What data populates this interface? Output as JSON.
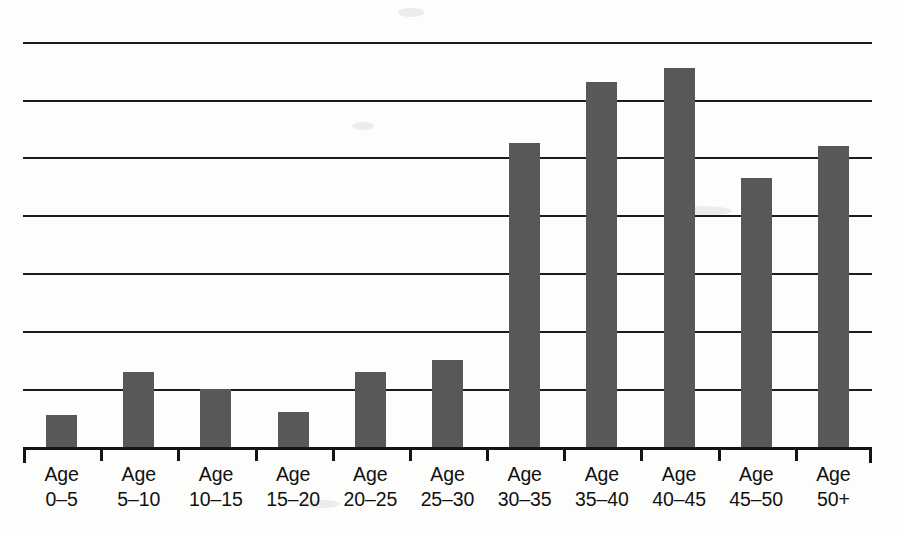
{
  "chart_data": {
    "type": "bar",
    "title": "",
    "subtitle": "",
    "xlabel": "",
    "ylabel": "",
    "categories": [
      "Age 0–5",
      "Age 5–10",
      "Age 10–15",
      "Age 15–20",
      "Age 20–25",
      "Age 25–30",
      "Age 30–35",
      "Age 35–40",
      "Age 40–45",
      "Age 45–50",
      "Age 50+"
    ],
    "category_lines": [
      [
        "Age",
        "0–5"
      ],
      [
        "Age",
        "5–10"
      ],
      [
        "Age",
        "10–15"
      ],
      [
        "Age",
        "15–20"
      ],
      [
        "Age",
        "20–25"
      ],
      [
        "Age",
        "25–30"
      ],
      [
        "Age",
        "30–35"
      ],
      [
        "Age",
        "35–40"
      ],
      [
        "Age",
        "40–45"
      ],
      [
        "Age",
        "45–50"
      ],
      [
        "Age",
        "50+"
      ]
    ],
    "values": [
      0.55,
      1.3,
      1.0,
      0.6,
      1.3,
      1.5,
      5.25,
      6.3,
      6.55,
      4.65,
      5.2
    ],
    "ylim": [
      0,
      7.2
    ],
    "y_gridline_values": [
      1,
      2,
      3,
      4,
      5,
      6,
      7
    ],
    "grid": true,
    "legend": false,
    "legend_position": "none",
    "axis_tick_labels": [],
    "colors": {
      "bar_fill": "#585858",
      "gridline": "#1c1c1c",
      "axis": "#151515",
      "label_text": "#111111",
      "background": "#fdfdfc"
    }
  }
}
